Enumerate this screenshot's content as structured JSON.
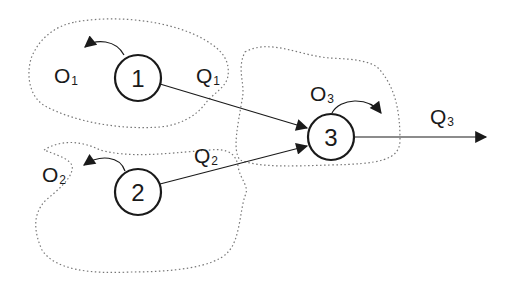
{
  "diagram": {
    "nodes": [
      {
        "id": "1",
        "label": "1",
        "cx": 138,
        "cy": 78
      },
      {
        "id": "2",
        "label": "2",
        "cx": 138,
        "cy": 192
      },
      {
        "id": "3",
        "label": "3",
        "cx": 331,
        "cy": 137
      }
    ],
    "labels": {
      "o1": {
        "main": "O",
        "sub": "1"
      },
      "o2": {
        "main": "O",
        "sub": "2"
      },
      "o3": {
        "main": "O",
        "sub": "3"
      },
      "q1": {
        "main": "Q",
        "sub": "1"
      },
      "q2": {
        "main": "Q",
        "sub": "2"
      },
      "q3": {
        "main": "Q",
        "sub": "3"
      }
    },
    "edges": [
      {
        "from": "1",
        "to": "3",
        "label": "Q1"
      },
      {
        "from": "2",
        "to": "3",
        "label": "Q2"
      },
      {
        "from": "3",
        "to": "out",
        "label": "Q3"
      }
    ],
    "outflows": [
      {
        "node": "1",
        "label": "O1"
      },
      {
        "node": "2",
        "label": "O2"
      },
      {
        "node": "3",
        "label": "O3"
      }
    ],
    "colors": {
      "stroke": "#1a1a1a",
      "dotted": "#777777"
    }
  }
}
